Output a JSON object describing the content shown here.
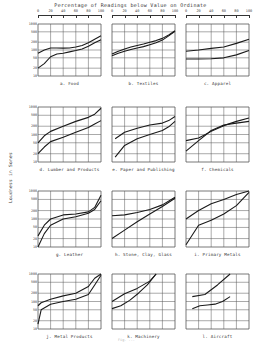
{
  "figure": {
    "title": "Percentage of Readings below Value on Ordinate",
    "ylabel": "Loudness in Sones",
    "caption": "Fig. ..."
  },
  "top_axis": {
    "ticks": [
      "0",
      "20",
      "40",
      "60",
      "80",
      "100"
    ]
  },
  "y_axis": {
    "ticks": [
      "1000",
      "500",
      "200",
      "100",
      "50",
      "20",
      "10"
    ]
  },
  "chart_data": [
    {
      "type": "line",
      "panel": "a",
      "title": "a. Food",
      "xlabel": "Percentage of Readings below Value on Ordinate",
      "ylabel": "Loudness in Sones",
      "yscale": "log",
      "ylim": [
        10,
        1000
      ],
      "xlim": [
        0,
        100
      ],
      "x": [
        0,
        10,
        20,
        30,
        40,
        50,
        60,
        70,
        80,
        90,
        100
      ],
      "series": [
        {
          "name": "upper",
          "values": [
            75,
            100,
            120,
            120,
            118,
            120,
            130,
            150,
            190,
            260,
            350
          ]
        },
        {
          "name": "lower",
          "values": [
            20,
            30,
            55,
            70,
            75,
            85,
            95,
            110,
            140,
            190,
            250
          ]
        }
      ]
    },
    {
      "type": "line",
      "panel": "b",
      "title": "b. Textiles",
      "yscale": "log",
      "ylim": [
        10,
        1000
      ],
      "xlim": [
        0,
        100
      ],
      "x": [
        0,
        10,
        20,
        30,
        40,
        50,
        60,
        70,
        80,
        90,
        100
      ],
      "series": [
        {
          "name": "upper",
          "values": [
            70,
            90,
            110,
            130,
            150,
            170,
            200,
            230,
            280,
            380,
            550
          ]
        },
        {
          "name": "lower",
          "values": [
            60,
            75,
            90,
            105,
            120,
            135,
            160,
            190,
            240,
            350,
            520
          ]
        }
      ]
    },
    {
      "type": "line",
      "panel": "c",
      "title": "c. Apparel",
      "yscale": "log",
      "ylim": [
        10,
        1000
      ],
      "xlim": [
        0,
        100
      ],
      "x": [
        0,
        20,
        40,
        60,
        80,
        100
      ],
      "series": [
        {
          "name": "upper",
          "values": [
            90,
            100,
            115,
            130,
            180,
            260
          ]
        },
        {
          "name": "lower",
          "values": [
            45,
            45,
            46,
            50,
            65,
            95
          ]
        }
      ]
    },
    {
      "type": "line",
      "panel": "d",
      "title": "d. Lumber and Products",
      "yscale": "log",
      "ylim": [
        10,
        1000
      ],
      "xlim": [
        0,
        100
      ],
      "x": [
        0,
        10,
        20,
        40,
        60,
        80,
        90,
        100
      ],
      "series": [
        {
          "name": "upper",
          "values": [
            50,
            90,
            130,
            200,
            300,
            420,
            550,
            900
          ]
        },
        {
          "name": "lower",
          "values": [
            20,
            35,
            55,
            80,
            120,
            180,
            240,
            320
          ]
        }
      ]
    },
    {
      "type": "line",
      "panel": "e",
      "title": "e. Paper and Publishing",
      "yscale": "log",
      "ylim": [
        10,
        1000
      ],
      "xlim": [
        0,
        100
      ],
      "x": [
        5,
        20,
        40,
        60,
        80,
        90,
        100
      ],
      "series": [
        {
          "name": "upper",
          "values": [
            70,
            120,
            170,
            220,
            260,
            320,
            450
          ]
        },
        {
          "name": "lower",
          "values": [
            15,
            40,
            70,
            100,
            140,
            190,
            300
          ]
        }
      ]
    },
    {
      "type": "line",
      "panel": "f",
      "title": "f. Chemicals",
      "yscale": "log",
      "ylim": [
        10,
        1000
      ],
      "xlim": [
        0,
        100
      ],
      "x": [
        0,
        20,
        40,
        60,
        80,
        100
      ],
      "series": [
        {
          "name": "upper",
          "values": [
            60,
            75,
            130,
            210,
            300,
            400
          ]
        },
        {
          "name": "lower",
          "values": [
            25,
            60,
            140,
            220,
            260,
            300
          ]
        }
      ]
    },
    {
      "type": "line",
      "panel": "g",
      "title": "g. Leather",
      "yscale": "log",
      "ylim": [
        10,
        1000
      ],
      "xlim": [
        0,
        100
      ],
      "x": [
        0,
        10,
        20,
        40,
        60,
        80,
        90,
        100
      ],
      "series": [
        {
          "name": "upper",
          "values": [
            25,
            60,
            100,
            140,
            150,
            180,
            260,
            700
          ]
        },
        {
          "name": "lower",
          "values": [
            10,
            30,
            60,
            100,
            120,
            160,
            220,
            450
          ]
        }
      ]
    },
    {
      "type": "line",
      "panel": "h",
      "title": "h. Stone, Clay, Glass",
      "yscale": "log",
      "ylim": [
        10,
        1000
      ],
      "xlim": [
        0,
        100
      ],
      "x": [
        0,
        20,
        40,
        60,
        80,
        100
      ],
      "series": [
        {
          "name": "upper",
          "values": [
            130,
            140,
            170,
            220,
            320,
            600
          ]
        },
        {
          "name": "lower",
          "values": [
            20,
            40,
            80,
            150,
            280,
            550
          ]
        }
      ]
    },
    {
      "type": "line",
      "panel": "i",
      "title": "i. Primary Metals",
      "yscale": "log",
      "ylim": [
        10,
        1000
      ],
      "xlim": [
        0,
        100
      ],
      "x": [
        0,
        20,
        40,
        60,
        80,
        100
      ],
      "series": [
        {
          "name": "upper",
          "values": [
            100,
            200,
            350,
            500,
            750,
            1000
          ]
        },
        {
          "name": "lower",
          "values": [
            12,
            60,
            90,
            150,
            300,
            900
          ]
        }
      ]
    },
    {
      "type": "line",
      "panel": "j",
      "title": "j. Metal Products",
      "yscale": "log",
      "ylim": [
        10,
        1000
      ],
      "xlim": [
        0,
        100
      ],
      "x": [
        0,
        5,
        20,
        40,
        60,
        80,
        90,
        100
      ],
      "series": [
        {
          "name": "upper",
          "values": [
            70,
            90,
            120,
            160,
            200,
            350,
            700,
            1000
          ]
        },
        {
          "name": "lower",
          "values": [
            15,
            50,
            80,
            100,
            120,
            180,
            400,
            900
          ]
        }
      ]
    },
    {
      "type": "line",
      "panel": "k",
      "title": "k. Machinery",
      "yscale": "log",
      "ylim": [
        10,
        1000
      ],
      "xlim": [
        0,
        100
      ],
      "x": [
        0,
        20,
        40,
        60,
        70
      ],
      "series": [
        {
          "name": "upper",
          "values": [
            100,
            190,
            300,
            550,
            1000
          ]
        },
        {
          "name": "lower",
          "values": [
            55,
            70,
            110,
            200,
            400,
            1000
          ]
        }
      ]
    },
    {
      "type": "line",
      "panel": "l",
      "title": "l. Aircraft",
      "yscale": "log",
      "ylim": [
        10,
        1000
      ],
      "xlim": [
        0,
        100
      ],
      "x": [
        10,
        30,
        50,
        70
      ],
      "series": [
        {
          "name": "upper",
          "values": [
            150,
            180,
            400,
            1000
          ]
        },
        {
          "name": "lower",
          "values": [
            55,
            70,
            75,
            80,
            100,
            150
          ]
        }
      ]
    }
  ]
}
